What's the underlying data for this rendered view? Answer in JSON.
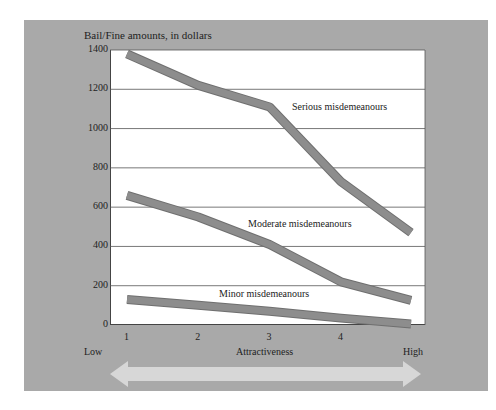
{
  "chart_data": {
    "type": "line",
    "title": "",
    "ylabel": "Bail/Fine amounts, in dollars",
    "xlabel": "Attractiveness",
    "x": [
      1,
      2,
      3,
      4,
      5
    ],
    "x_tick_labels": [
      "1",
      "2",
      "3",
      "4"
    ],
    "x_end_labels": {
      "low": "Low",
      "high": "High"
    },
    "ylim": [
      0,
      1400
    ],
    "y_ticks": [
      0,
      200,
      400,
      600,
      800,
      1000,
      1200,
      1400
    ],
    "grid": true,
    "legend": "inline labels",
    "series": [
      {
        "name": "Serious misdemeanours",
        "values": [
          1380,
          1220,
          1110,
          730,
          470
        ]
      },
      {
        "name": "Moderate misdemeanours",
        "values": [
          660,
          550,
          410,
          220,
          125
        ]
      },
      {
        "name": "Minor misdemeanours",
        "values": [
          130,
          100,
          70,
          35,
          5
        ]
      }
    ],
    "annotations": [
      "Double-headed arrow under x-axis spanning Low to High"
    ]
  },
  "labels": {
    "ytitle": "Bail/Fine amounts, in dollars",
    "xtitle": "Attractiveness",
    "low": "Low",
    "high": "High",
    "serious": "Serious misdemeanours",
    "moderate": "Moderate misdemeanours",
    "minor": "Minor misdemeanours"
  },
  "yticks": [
    "1400",
    "1200",
    "1000",
    "800",
    "600",
    "400",
    "200",
    "0"
  ],
  "xticks": [
    "1",
    "2",
    "3",
    "4"
  ],
  "colors": {
    "panel": "#a9a9a9",
    "line": "#8d8d8d",
    "line_edge": "#6f6f6f",
    "arrow": "#dcdcdc"
  }
}
